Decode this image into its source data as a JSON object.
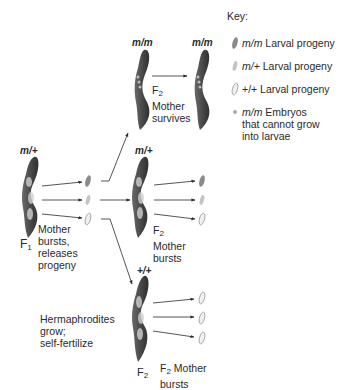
{
  "figure": {
    "type": "genetics-cross-diagram"
  },
  "key": {
    "title": "Key:",
    "items": [
      {
        "genotype": "m/m",
        "text": " Larval progeny",
        "icon": "dark-larva-icon"
      },
      {
        "genotype": "m/+",
        "text": " Larval progeny",
        "icon": "light-larva-icon"
      },
      {
        "genotype": "+/+",
        "text": " Larval progeny",
        "icon": "outlined-larva-icon"
      },
      {
        "genotype": "m/m",
        "text": " Embryos that cannot grow into larvae",
        "icon": "embryo-dot-icon"
      }
    ]
  },
  "f1": {
    "genotype": "m/+",
    "generation": "F",
    "generation_sub": "1",
    "caption": [
      "Mother",
      "bursts,",
      "releases",
      "progeny"
    ]
  },
  "f2_mm": {
    "genotype": "m/m",
    "generation": "F",
    "generation_sub": "2",
    "caption": [
      "Mother",
      "survives"
    ],
    "offspring_genotype": "m/m"
  },
  "f2_mp": {
    "genotype": "m/+",
    "generation": "F",
    "generation_sub": "2",
    "caption": [
      "Mother",
      "bursts"
    ]
  },
  "f2_pp": {
    "genotype": "+/+",
    "generation": "F",
    "generation_sub": "2",
    "caption_gen": "F",
    "caption_sub": "2",
    "caption": [
      " Mother",
      "bursts"
    ]
  },
  "side_note": [
    "Hermaphrodites",
    "grow;",
    "self-fertilize"
  ],
  "colors": {
    "worm_body": "#5a5a5a",
    "worm_dark": "#3e3e3e",
    "larva_dark": "#8a8a8a",
    "larva_light": "#c4c4c4",
    "arrow": "#2a2a2a"
  }
}
